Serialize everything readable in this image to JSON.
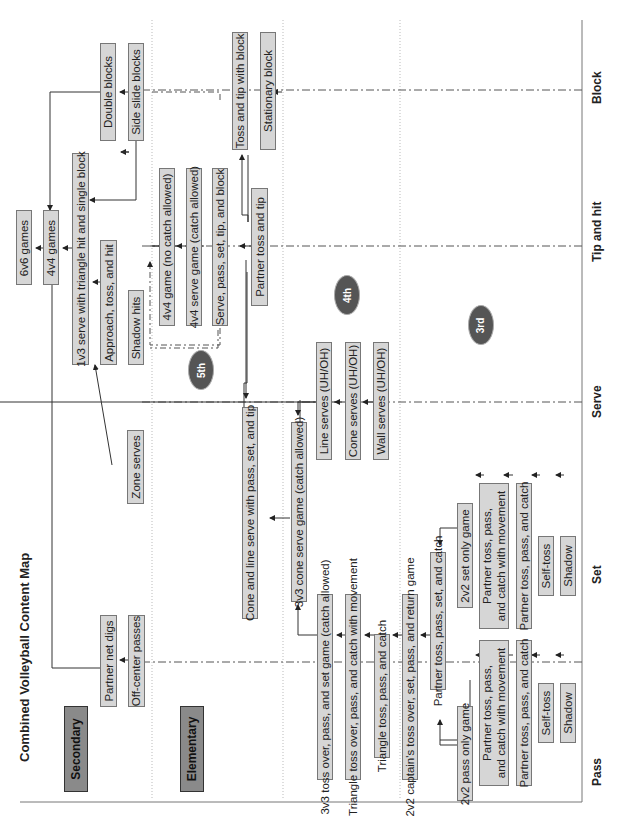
{
  "title": "Combined Volleyball Content Map",
  "levels": {
    "secondary": "Secondary",
    "elementary": "Elementary"
  },
  "grades": {
    "fifth": "5th",
    "fourth": "4th",
    "third": "3rd"
  },
  "axis": {
    "pass": "Pass",
    "set": "Set",
    "serve": "Serve",
    "tip_hit": "Tip and hit",
    "block": "Block"
  },
  "nodes": {
    "n6v6": "6v6 games",
    "n4v4": "4v4 games",
    "n1v3": "1v3 serve with triangle hit and single block",
    "approach": "Approach, toss, and hit",
    "shadow_hits": "Shadow hits",
    "double_blocks": "Double blocks",
    "side_slide": "Side slide blocks",
    "partner_net_digs": "Partner net digs",
    "off_center": "Off-center passes",
    "zone_serves": "Zone serves",
    "g4v4_nocatch": "4v4 game (no catch allowed)",
    "g4v4_serve": "4v4 serve game (catch allowed)",
    "spstb": "Serve, pass, set, tip, and block",
    "partner_toss_tip": "Partner toss and tip",
    "toss_tip_block": "Toss and tip with block",
    "stationary_block": "Stationary block",
    "cone_line": "Cone and line serve with pass, set, and tip",
    "cone_game": "3v3 cone serve game (catch allowed)",
    "line_serves": "Line serves (UH/OH)",
    "cone_serves": "Cone serves (UH/OH)",
    "wall_serves": "Wall serves (UH/OH)",
    "toss_over_3v3": "3v3 toss over, pass, and set game (catch allowed)",
    "triangle_move": "Triangle toss over, pass, and catch with movement",
    "triangle_toss": "Triangle toss, pass, and catch",
    "captains": "2v2 captain's toss over, set, pass, and return game",
    "partner_psc": "Partner toss, pass, set, and catch",
    "pass_only": "2v2 pass only game",
    "pass_move": "Partner toss, pass,\nand catch with movement",
    "pass_ptpc": "Partner toss, pass, and catch",
    "pass_self": "Self-toss",
    "pass_shadow": "Shadow",
    "set_only": "2v2 set only game",
    "set_move": "Partner toss, pass,\nand catch with movement",
    "set_ptpc": "Partner toss, pass, and catch",
    "set_self": "Self-toss",
    "set_shadow": "Shadow"
  }
}
